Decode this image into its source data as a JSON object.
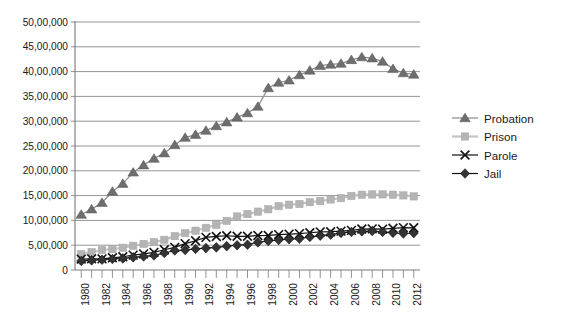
{
  "chart_data": {
    "type": "line",
    "title": "",
    "subtitle": "",
    "xlabel": "",
    "ylabel": "",
    "grid": true,
    "legend_position": "right",
    "number_format": "indian-lakh-crore",
    "x": [
      1980,
      1981,
      1982,
      1983,
      1984,
      1985,
      1986,
      1987,
      1988,
      1989,
      1990,
      1991,
      1992,
      1993,
      1994,
      1995,
      1996,
      1997,
      1998,
      1999,
      2000,
      2001,
      2002,
      2003,
      2004,
      2005,
      2006,
      2007,
      2008,
      2009,
      2010,
      2011,
      2012
    ],
    "xtick_labels": [
      "1980",
      "1982",
      "1984",
      "1986",
      "1988",
      "1990",
      "1992",
      "1994",
      "1996",
      "1998",
      "2000",
      "2002",
      "2004",
      "2006",
      "2008",
      "2010",
      "2012"
    ],
    "xtick_values": [
      1980,
      1982,
      1984,
      1986,
      1988,
      1990,
      1992,
      1994,
      1996,
      1998,
      2000,
      2002,
      2004,
      2006,
      2008,
      2010,
      2012
    ],
    "xlim": [
      1979.4,
      2012.6
    ],
    "ylim": [
      0,
      5000000
    ],
    "ytick_values": [
      0,
      500000,
      1000000,
      1500000,
      2000000,
      2500000,
      3000000,
      3500000,
      4000000,
      4500000,
      5000000
    ],
    "ytick_labels": [
      "0",
      "5,00,000",
      "10,00,000",
      "15,00,000",
      "20,00,000",
      "25,00,000",
      "30,00,000",
      "35,00,000",
      "40,00,000",
      "45,00,000",
      "50,00,000"
    ],
    "series": [
      {
        "name": "Probation",
        "marker": "triangle",
        "color": "#6e6e6e",
        "line_color": "#8a8a8a",
        "values": [
          1118097,
          1225934,
          1357264,
          1582947,
          1740948,
          1968712,
          2114621,
          2247158,
          2356483,
          2522125,
          2670234,
          2728472,
          2811611,
          2903061,
          2981022,
          3077861,
          3164996,
          3296513,
          3670441,
          3779922,
          3826209,
          3931731,
          4024067,
          4120012,
          4143792,
          4162536,
          4236800,
          4293163,
          4270917,
          4203967,
          4055514,
          3971319,
          3942800
        ]
      },
      {
        "name": "Prison",
        "marker": "square",
        "color": "#b4b4b4",
        "line_color": "#c4c4c4",
        "values": [
          319598,
          360029,
          402914,
          423898,
          448264,
          487593,
          526436,
          562814,
          607766,
          683367,
          743382,
          792535,
          850566,
          909381,
          990147,
          1078542,
          1127528,
          1176564,
          1224469,
          1287172,
          1316333,
          1330007,
          1367547,
          1390279,
          1421345,
          1448344,
          1492973,
          1517867,
          1522834,
          1524513,
          1518104,
          1504150,
          1483900
        ]
      },
      {
        "name": "Parole",
        "marker": "x",
        "color": "#111111",
        "line_color": "#111111",
        "values": [
          220438,
          225539,
          224604,
          246440,
          266992,
          300203,
          325638,
          355505,
          407977,
          456803,
          531407,
          590442,
          658601,
          676100,
          690371,
          679421,
          679733,
          694787,
          696385,
          714457,
          723898,
          732333,
          750934,
          769925,
          771852,
          784408,
          798202,
          826097,
          828169,
          824365,
          840676,
          853852,
          851200
        ]
      },
      {
        "name": "Jail",
        "marker": "diamond",
        "color": "#333333",
        "line_color": "#1a1a1a",
        "values": [
          182288,
          195085,
          207853,
          221815,
          233018,
          254986,
          272736,
          294092,
          341893,
          393303,
          403019,
          424129,
          441781,
          455500,
          479800,
          499300,
          510400,
          557974,
          584372,
          605943,
          621149,
          631240,
          665475,
          691301,
          713990,
          747529,
          765819,
          780174,
          785533,
          767434,
          748728,
          735601,
          744500
        ]
      }
    ],
    "legend": [
      {
        "label": "Probation",
        "marker": "triangle",
        "color": "#6e6e6e"
      },
      {
        "label": "Prison",
        "marker": "square",
        "color": "#b4b4b4"
      },
      {
        "label": "Parole",
        "marker": "x",
        "color": "#111111"
      },
      {
        "label": "Jail",
        "marker": "diamond",
        "color": "#333333"
      }
    ]
  }
}
